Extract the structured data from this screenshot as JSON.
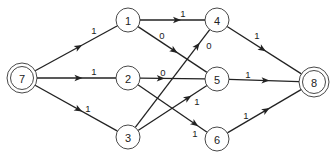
{
  "diagram": {
    "type": "flow-network",
    "colors": {
      "stroke": "#222222",
      "background": "#ffffff"
    },
    "nodes": [
      {
        "id": "7",
        "label": "7",
        "x": 22,
        "y": 78,
        "r": 15,
        "double": true,
        "role": "source"
      },
      {
        "id": "1",
        "label": "1",
        "x": 128,
        "y": 20,
        "r": 12,
        "double": false
      },
      {
        "id": "2",
        "label": "2",
        "x": 128,
        "y": 78,
        "r": 12,
        "double": false
      },
      {
        "id": "3",
        "label": "3",
        "x": 128,
        "y": 137,
        "r": 12,
        "double": false
      },
      {
        "id": "4",
        "label": "4",
        "x": 217,
        "y": 20,
        "r": 12,
        "double": false
      },
      {
        "id": "5",
        "label": "5",
        "x": 217,
        "y": 79,
        "r": 12,
        "double": false
      },
      {
        "id": "6",
        "label": "6",
        "x": 217,
        "y": 139,
        "r": 12,
        "double": false
      },
      {
        "id": "8",
        "label": "8",
        "x": 314,
        "y": 82,
        "r": 15,
        "double": true,
        "role": "sink"
      }
    ],
    "edges": [
      {
        "from": "7",
        "to": "1",
        "label": "1",
        "lx": 94,
        "ly": 30,
        "arrow_t": 0.55
      },
      {
        "from": "7",
        "to": "2",
        "label": "1",
        "lx": 94,
        "ly": 71,
        "arrow_t": 0.55
      },
      {
        "from": "7",
        "to": "3",
        "label": "1",
        "lx": 88,
        "ly": 108,
        "arrow_t": 0.55
      },
      {
        "from": "1",
        "to": "4",
        "label": "1",
        "lx": 183,
        "ly": 13,
        "arrow_t": 0.6
      },
      {
        "from": "1",
        "to": "5",
        "label": "0",
        "lx": 162,
        "ly": 35,
        "arrow_t": 0.55
      },
      {
        "from": "2",
        "to": "5",
        "label": "0",
        "lx": 163,
        "ly": 72,
        "arrow_t": 0.35
      },
      {
        "from": "2",
        "to": "6",
        "label": "1",
        "lx": 195,
        "ly": 133,
        "arrow_t": 0.85
      },
      {
        "from": "3",
        "to": "4",
        "label": "0",
        "lx": 209,
        "ly": 45,
        "arrow_t": 0.85
      },
      {
        "from": "3",
        "to": "5",
        "label": "1",
        "lx": 197,
        "ly": 101,
        "arrow_t": 0.75
      },
      {
        "from": "4",
        "to": "8",
        "label": "1",
        "lx": 257,
        "ly": 35,
        "arrow_t": 0.5
      },
      {
        "from": "5",
        "to": "8",
        "label": "1",
        "lx": 248,
        "ly": 74,
        "arrow_t": 0.55
      },
      {
        "from": "6",
        "to": "8",
        "label": "1",
        "lx": 246,
        "ly": 115,
        "arrow_t": 0.55
      }
    ]
  }
}
